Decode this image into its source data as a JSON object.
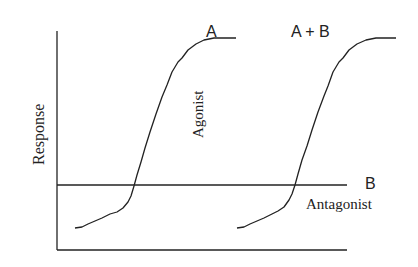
{
  "diagram": {
    "y_axis_label": "Response",
    "curves": [
      {
        "id": "A",
        "label": "A",
        "annotation": "Agonist"
      },
      {
        "id": "A+B",
        "label": "A + B"
      },
      {
        "id": "B",
        "label": "B",
        "annotation": "Antagonist"
      }
    ],
    "colors": {
      "line": "#222222",
      "background": "#ffffff"
    }
  }
}
